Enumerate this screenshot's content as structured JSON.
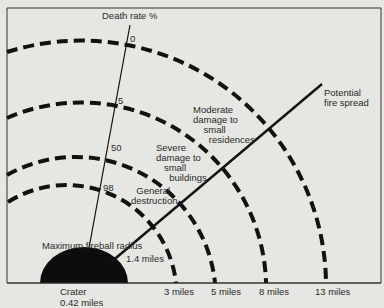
{
  "diagram": {
    "axis_title": "Death rate %",
    "death_rate_ticks": [
      {
        "label": "0"
      },
      {
        "label": "5"
      },
      {
        "label": "50"
      },
      {
        "label": "98"
      }
    ],
    "zones": {
      "moderate": "Moderate\ndamage to\n    small\n      residences",
      "severe": "Severe\ndamage to\n   small\n     buildings",
      "general": "  General\ndestruction"
    },
    "fire_spread": "Potential\nfire spread",
    "fireball": {
      "label": "Maximum fireball radius",
      "value": "1.4 miles"
    },
    "crater": {
      "label": "Crater",
      "value": "0.42 miles"
    },
    "distances": [
      {
        "label": "3 miles"
      },
      {
        "label": "5 miles"
      },
      {
        "label": "8 miles"
      },
      {
        "label": "13 miles"
      }
    ],
    "colors": {
      "background": "#e6e6e3",
      "ink": "#111111",
      "text": "#2a2a2a"
    }
  }
}
